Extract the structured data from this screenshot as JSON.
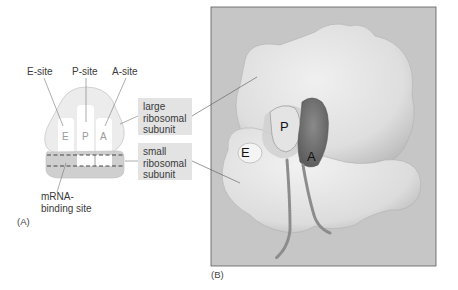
{
  "panel_a": {
    "label": "(A)",
    "site_labels": [
      {
        "text": "E-site"
      },
      {
        "text": "P-site"
      },
      {
        "text": "A-site"
      }
    ],
    "site_letters": [
      "E",
      "P",
      "A"
    ],
    "large_subunit_box": {
      "line1": "large",
      "line2": "ribosomal",
      "line3": "subunit"
    },
    "small_subunit_box": {
      "line1": "small",
      "line2": "ribosomal",
      "line3": "subunit"
    },
    "mrna_label": {
      "line1": "mRNA-",
      "line2": "binding site"
    }
  },
  "panel_b": {
    "label": "(B)",
    "site_letters": [
      "E",
      "P",
      "A"
    ]
  },
  "colors": {
    "large_subunit_fill": "#ececec",
    "small_subunit_fill": "#cfcfcf",
    "label_box_fill": "#e3e3e3",
    "site_column_fill": "#ffffff",
    "photo_background": "#c4c4c4",
    "tRNA_A_dark": "#6e6e6e"
  }
}
